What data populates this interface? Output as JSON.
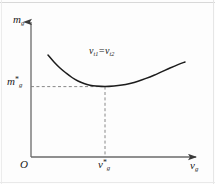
{
  "chart_data": {
    "type": "line",
    "title": "",
    "xlabel": "v_g",
    "ylabel": "m_g",
    "annotation": "v_t1 = v_t2",
    "grid": false,
    "legend": null,
    "axis_origin_label": "O",
    "x_tick_labels": [
      "v_g*"
    ],
    "y_tick_labels": [
      "m_g*"
    ],
    "x_ticks": [
      105
    ],
    "y_ticks": [
      86
    ],
    "xlim": [
      31,
      200
    ],
    "ylim": [
      157,
      18
    ],
    "minimum_point": {
      "x": 105,
      "y": 86,
      "x_label": "v_g*",
      "y_label": "m_g*"
    },
    "series": [
      {
        "name": "m_g(v_g)",
        "style": "solid",
        "color": "#1c1c1c",
        "points": [
          [
            48,
            55
          ],
          [
            54,
            62
          ],
          [
            60,
            68
          ],
          [
            66,
            73
          ],
          [
            72,
            77.5
          ],
          [
            78,
            81
          ],
          [
            84,
            83.5
          ],
          [
            90,
            85.2
          ],
          [
            96,
            86.1
          ],
          [
            105,
            86.6
          ],
          [
            114,
            86.1
          ],
          [
            122,
            85.1
          ],
          [
            130,
            83.4
          ],
          [
            138,
            81.2
          ],
          [
            146,
            78.4
          ],
          [
            154,
            75.2
          ],
          [
            162,
            71.6
          ],
          [
            170,
            68
          ],
          [
            178,
            64.6
          ],
          [
            185,
            62
          ]
        ]
      }
    ],
    "guides": [
      {
        "name": "horizontal-guide",
        "style": "dashed",
        "from": [
          31,
          86
        ],
        "to": [
          105,
          86
        ]
      },
      {
        "name": "vertical-guide",
        "style": "dashed",
        "from": [
          105,
          86
        ],
        "to": [
          105,
          157
        ]
      }
    ]
  },
  "labels": {
    "y_axis": {
      "symbol": "m",
      "subscript": "g"
    },
    "x_axis": {
      "symbol": "v",
      "subscript": "g"
    },
    "origin": "O",
    "y_tick": {
      "symbol": "m",
      "subscript": "g",
      "superscript": "*"
    },
    "x_tick": {
      "symbol": "v",
      "subscript": "g",
      "superscript": "*"
    },
    "annotation": {
      "left_symbol": "v",
      "left_subscript": "t1",
      "equals": "=",
      "right_symbol": "v",
      "right_subscript": "t2"
    }
  },
  "colors": {
    "curve": "#1c1c1c",
    "axis": "#6a6a6a",
    "guide": "#7a7a7a",
    "text": "#1a1a1a",
    "background": "#fdfdfd"
  }
}
